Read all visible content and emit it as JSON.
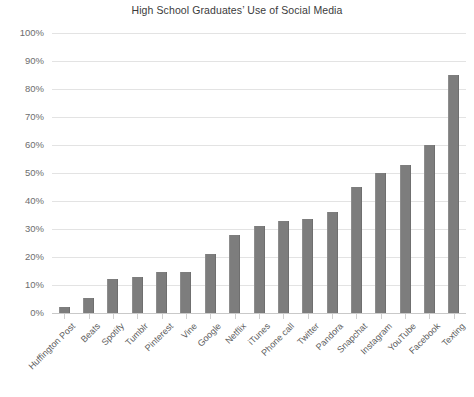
{
  "chart_data": {
    "type": "bar",
    "title": "High School Graduates’ Use of Social Media",
    "xlabel": "",
    "ylabel": "",
    "ylim": [
      0,
      100
    ],
    "ytick_labels": [
      "0%",
      "10%",
      "20%",
      "30%",
      "40%",
      "50%",
      "60%",
      "70%",
      "80%",
      "90%",
      "100%"
    ],
    "yticks": [
      0,
      10,
      20,
      30,
      40,
      50,
      60,
      70,
      80,
      90,
      100
    ],
    "grid": true,
    "legend": false,
    "legend_position": "none",
    "bar_color": "#7d7d7d",
    "gridline_color": "#e3e3e3",
    "categories": [
      "Huffington Post",
      "Beats",
      "Spotify",
      "Tumblr",
      "Pinterest",
      "Vine",
      "Google",
      "Netflix",
      "iTunes",
      "Phone call",
      "Twitter",
      "Pandora",
      "Snapchat",
      "Instagram",
      "YouTube",
      "Facebook",
      "Texting"
    ],
    "values": [
      2,
      5.5,
      12,
      13,
      14.5,
      14.5,
      21,
      28,
      31,
      33,
      33.5,
      36,
      45,
      50,
      53,
      60,
      85
    ]
  }
}
